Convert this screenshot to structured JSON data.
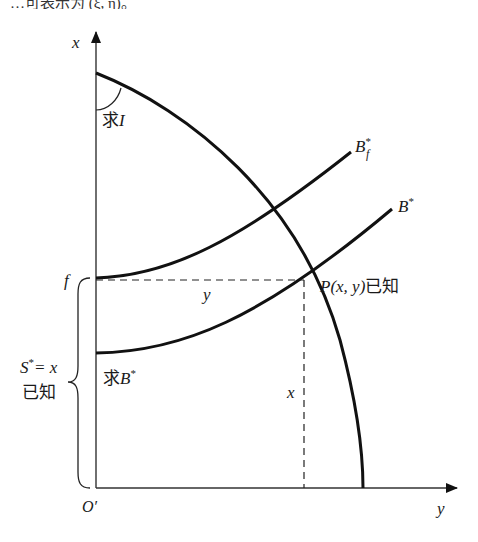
{
  "caption_fragment": "…可表示为 (ξ, η)。",
  "axes": {
    "vertical_label": "x",
    "horizontal_label": "y",
    "origin_label": "O′"
  },
  "labels": {
    "angle_label_cn": "求",
    "angle_label_var": "I",
    "curve_bf_main": "B",
    "curve_bf_sup": "*",
    "curve_bf_sub": "f",
    "curve_b_main": "B",
    "curve_b_sup": "*",
    "f_tick": "f",
    "y_segment": "y",
    "x_segment": "x",
    "point_label": "P(x, y)",
    "point_known": "已知",
    "brace_line1_S": "S",
    "brace_line1_sup": "*",
    "brace_line1_rest": "= x",
    "brace_line2": "已知",
    "find_b_cn": "求",
    "find_b_var": "B",
    "find_b_sup": "*"
  },
  "geometry": {
    "origin": [
      96,
      488
    ],
    "x_axis_top": [
      96,
      32
    ],
    "y_axis_right": [
      457,
      488
    ],
    "arc_start": [
      96,
      73
    ],
    "arc_end": [
      363,
      488
    ],
    "point_P": [
      304,
      280
    ],
    "f_level_y": 278,
    "b_start_y": 353,
    "bf_end": [
      351,
      152
    ],
    "b_end": [
      392,
      209
    ]
  },
  "colors": {
    "line": "#111111",
    "axis": "#333333",
    "text": "#1a1a1a",
    "background": "#ffffff"
  }
}
